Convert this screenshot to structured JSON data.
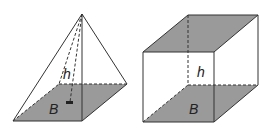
{
  "figures": [
    {
      "name": "pyramid",
      "height_label": "h",
      "base_label": "B"
    },
    {
      "name": "prism",
      "height_label": "h",
      "base_label": "B"
    }
  ],
  "colors": {
    "base_fill": "#9a9a9a",
    "stroke": "#333333",
    "background": "#ffffff"
  }
}
